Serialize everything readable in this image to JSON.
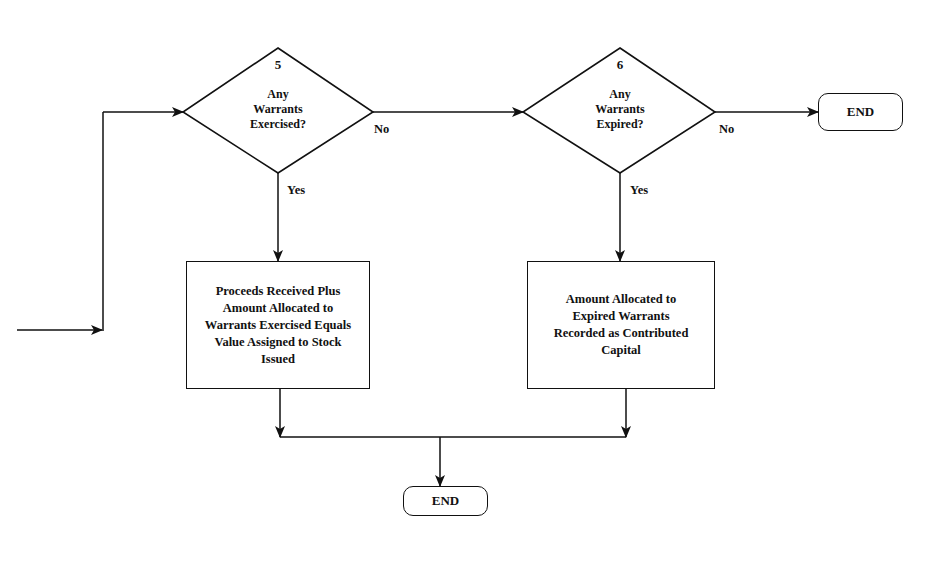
{
  "diagram": {
    "type": "flowchart",
    "nodes": {
      "decision_5": {
        "number": "5",
        "line1": "Any",
        "line2": "Warrants",
        "line3": "Exercised?"
      },
      "decision_6": {
        "number": "6",
        "line1": "Any",
        "line2": "Warrants",
        "line3": "Expired?"
      },
      "process_exercised": {
        "line1": "Proceeds Received Plus",
        "line2": "Amount Allocated to",
        "line3": "Warrants Exercised Equals",
        "line4": "Value Assigned to Stock",
        "line5": "Issued"
      },
      "process_expired": {
        "line1": "Amount Allocated to",
        "line2": "Expired Warrants",
        "line3": "Recorded as Contributed",
        "line4": "Capital"
      },
      "end_top": {
        "label": "END"
      },
      "end_bottom": {
        "label": "END"
      }
    },
    "edge_labels": {
      "d5_no": "No",
      "d5_yes": "Yes",
      "d6_no": "No",
      "d6_yes": "Yes"
    },
    "edges": [
      {
        "from": "entry",
        "to": "decision_5"
      },
      {
        "from": "decision_5",
        "to": "decision_6",
        "label": "No"
      },
      {
        "from": "decision_5",
        "to": "process_exercised",
        "label": "Yes"
      },
      {
        "from": "decision_6",
        "to": "end_top",
        "label": "No"
      },
      {
        "from": "decision_6",
        "to": "process_expired",
        "label": "Yes"
      },
      {
        "from": "process_exercised",
        "to": "end_bottom"
      },
      {
        "from": "process_expired",
        "to": "end_bottom"
      }
    ]
  },
  "colors": {
    "stroke": "#111111",
    "background": "#ffffff",
    "bleed_text": "#d6d6d6"
  }
}
